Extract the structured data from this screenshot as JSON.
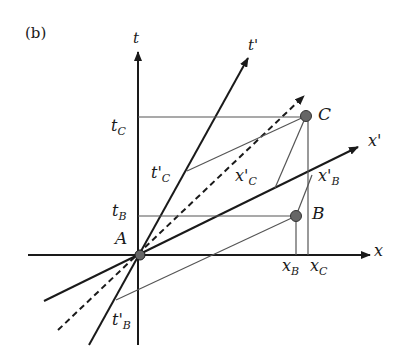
{
  "panel_label": "(b)",
  "axes": {
    "t": "t",
    "x": "x",
    "t_prime": "t'",
    "x_prime": "x'"
  },
  "events": {
    "A": "A",
    "B": "B",
    "C": "C"
  },
  "coordinates": {
    "t_C": {
      "main": "t",
      "sub": "C"
    },
    "t_B": {
      "main": "t",
      "sub": "B"
    },
    "x_B": {
      "main": "x",
      "sub": "B"
    },
    "x_C": {
      "main": "x",
      "sub": "C"
    },
    "tp_C": {
      "main": "t'",
      "sub": "C"
    },
    "xp_C": {
      "main": "x'",
      "sub": "C"
    },
    "xp_B": {
      "main": "x'",
      "sub": "B"
    },
    "tp_B": {
      "main": "t'",
      "sub": "B"
    }
  },
  "colors": {
    "ink": "#1a1a1a",
    "thin_line": "#555555",
    "point_fill": "#666666"
  }
}
